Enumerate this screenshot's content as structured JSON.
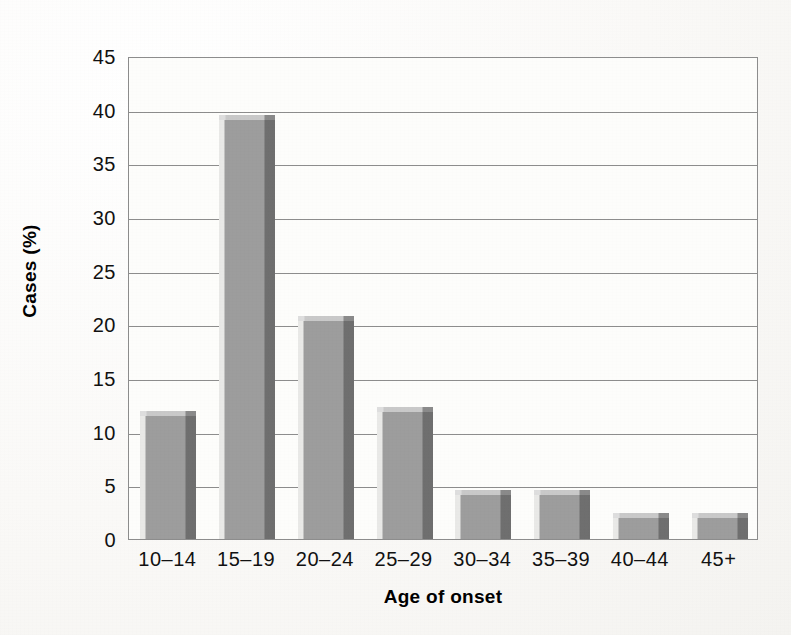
{
  "chart_data": {
    "type": "bar",
    "title": "",
    "xlabel": "Age of onset",
    "ylabel": "Cases (%)",
    "categories": [
      "10–14",
      "15–19",
      "20–24",
      "25–29",
      "30–34",
      "35–39",
      "40–44",
      "45+"
    ],
    "values": [
      11.9,
      39.5,
      20.8,
      12.3,
      4.6,
      4.6,
      2.4,
      2.4
    ],
    "ylim": [
      0,
      45
    ],
    "yticks": [
      "0",
      "5",
      "10",
      "15",
      "20",
      "25",
      "30",
      "35",
      "40",
      "45"
    ],
    "ytick_values": [
      0,
      5,
      10,
      15,
      20,
      25,
      30,
      35,
      40,
      45
    ],
    "grid": "horizontal",
    "legend": "none",
    "bar_color": "#9d9d9d",
    "bar_shadow_color": "#6f6f6f",
    "bar_highlight_color": "#e9e9e7",
    "axis_color": "#8d8d8d",
    "background_color": "#fdfdfb"
  }
}
